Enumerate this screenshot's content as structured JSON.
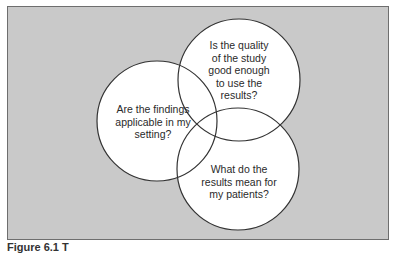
{
  "diagram": {
    "type": "venn",
    "background_color": "#c9c9c9",
    "circle_fill": "#ffffff",
    "circle_stroke": "#333333",
    "circles": [
      {
        "id": "applicability",
        "label": "Are the findings applicable in my setting?",
        "lines": [
          "Are the findings",
          "applicable in my",
          "setting?"
        ],
        "cx": 157,
        "cy": 121,
        "r": 60
      },
      {
        "id": "quality",
        "label": "Is the quality of the study good enough to use the results?",
        "lines": [
          "Is the quality",
          "of the study",
          "good enough",
          "to use the",
          "results?"
        ],
        "cx": 239,
        "cy": 80,
        "r": 61
      },
      {
        "id": "meaning",
        "label": "What do the results mean for my patients?",
        "lines": [
          "What do the",
          "results mean for",
          "my patients?"
        ],
        "cx": 238,
        "cy": 169,
        "r": 61
      }
    ]
  },
  "caption": {
    "text": "Figure 6.1 T"
  }
}
